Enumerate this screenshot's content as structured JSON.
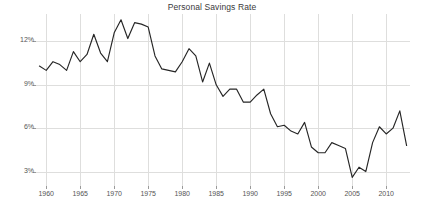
{
  "chart_data": {
    "type": "line",
    "title": "Personal Savings Rate",
    "xlabel": "",
    "ylabel": "",
    "xlim": [
      1958.5,
      2013.5
    ],
    "ylim": [
      2.0,
      13.9
    ],
    "grid": true,
    "legend": "none",
    "y_tick_labels": [
      "12%",
      "9%",
      "6%",
      "3%"
    ],
    "y_tick_values": [
      12,
      9,
      6,
      3
    ],
    "x_tick_labels": [
      "1960",
      "1965",
      "1970",
      "1975",
      "1980",
      "1985",
      "1990",
      "1995",
      "2000",
      "2005",
      "2010"
    ],
    "x_tick_values": [
      1960,
      1965,
      1970,
      1975,
      1980,
      1985,
      1990,
      1995,
      2000,
      2005,
      2010
    ],
    "series": [
      {
        "name": "Personal Savings Rate",
        "color": "#262626",
        "x": [
          1959,
          1960,
          1961,
          1962,
          1963,
          1964,
          1965,
          1966,
          1967,
          1968,
          1969,
          1970,
          1971,
          1972,
          1973,
          1974,
          1975,
          1976,
          1977,
          1978,
          1979,
          1980,
          1981,
          1982,
          1983,
          1984,
          1985,
          1986,
          1987,
          1988,
          1989,
          1990,
          1991,
          1992,
          1993,
          1994,
          1995,
          1996,
          1997,
          1998,
          1999,
          2000,
          2001,
          2002,
          2003,
          2004,
          2005,
          2006,
          2007,
          2008,
          2009,
          2010,
          2011,
          2012,
          2013
        ],
        "values": [
          10.3,
          10.0,
          10.6,
          10.4,
          10.0,
          11.3,
          10.6,
          11.1,
          12.5,
          11.2,
          10.6,
          12.6,
          13.5,
          12.2,
          13.3,
          13.2,
          13.0,
          11.0,
          10.1,
          10.0,
          9.9,
          10.6,
          11.5,
          11.0,
          9.2,
          10.5,
          9.0,
          8.2,
          8.7,
          8.7,
          7.8,
          7.8,
          8.3,
          8.7,
          7.0,
          6.1,
          6.2,
          5.8,
          5.6,
          6.4,
          4.7,
          4.3,
          4.3,
          5.0,
          4.8,
          4.6,
          2.6,
          3.3,
          3.0,
          5.0,
          6.1,
          5.6,
          6.0,
          7.2,
          4.8
        ]
      }
    ]
  }
}
